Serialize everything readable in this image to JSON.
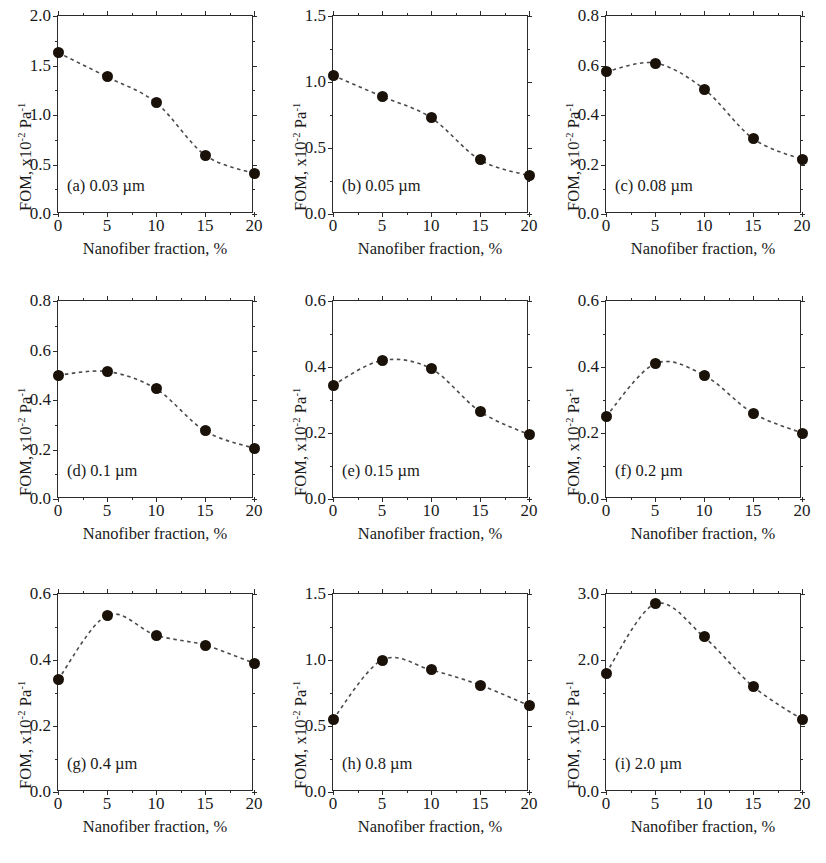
{
  "figure": {
    "panel_count": 9,
    "axis_x_title": "Nanofiber fraction, %",
    "axis_y_title_main": "FOM, x10",
    "axis_y_sup1": "-2",
    "axis_y_mid": " Pa",
    "axis_y_sup2": "-1",
    "marker_color": "#1a1209",
    "line_color": "#4a4a4a",
    "axis_color": "#2b2b2b"
  },
  "chart_data": [
    {
      "type": "scatter",
      "panel": "a",
      "title": "(a) 0.03 µm",
      "xlabel": "Nanofiber fraction, %",
      "ylabel": "FOM, x10-2 Pa-1",
      "x": [
        0,
        5,
        10,
        15,
        20
      ],
      "values": [
        1.63,
        1.385,
        1.125,
        0.595,
        0.41
      ],
      "xlim": [
        0,
        20
      ],
      "ylim": [
        0.0,
        2.0
      ],
      "xticks": [
        0,
        5,
        10,
        15,
        20
      ],
      "yticks": [
        0.0,
        0.5,
        1.0,
        1.5,
        2.0
      ],
      "ytick_labels": [
        "0.0",
        "0.5",
        "1.0",
        "1.5",
        "2.0"
      ],
      "grid": false,
      "legend": "none"
    },
    {
      "type": "scatter",
      "panel": "b",
      "title": "(b) 0.05 µm",
      "xlabel": "Nanofiber fraction, %",
      "ylabel": "FOM, x10-2 Pa-1",
      "x": [
        0,
        5,
        10,
        15,
        20
      ],
      "values": [
        1.05,
        0.89,
        0.73,
        0.41,
        0.29
      ],
      "xlim": [
        0,
        20
      ],
      "ylim": [
        0.0,
        1.5
      ],
      "xticks": [
        0,
        5,
        10,
        15,
        20
      ],
      "yticks": [
        0.0,
        0.5,
        1.0,
        1.5
      ],
      "ytick_labels": [
        "0.0",
        "0.5",
        "1.0",
        "1.5"
      ],
      "grid": false,
      "legend": "none"
    },
    {
      "type": "scatter",
      "panel": "c",
      "title": "(c) 0.08 µm",
      "xlabel": "Nanofiber fraction, %",
      "ylabel": "FOM, x10-2 Pa-1",
      "x": [
        0,
        5,
        10,
        15,
        20
      ],
      "values": [
        0.575,
        0.61,
        0.505,
        0.305,
        0.22
      ],
      "xlim": [
        0,
        20
      ],
      "ylim": [
        0.0,
        0.8
      ],
      "xticks": [
        0,
        5,
        10,
        15,
        20
      ],
      "yticks": [
        0.0,
        0.2,
        0.4,
        0.6,
        0.8
      ],
      "ytick_labels": [
        "0.0",
        "0.2",
        "0.4",
        "0.6",
        "0.8"
      ],
      "grid": false,
      "legend": "none"
    },
    {
      "type": "scatter",
      "panel": "d",
      "title": "(d) 0.1 µm",
      "xlabel": "Nanofiber fraction, %",
      "ylabel": "FOM, x10-2 Pa-1",
      "x": [
        0,
        5,
        10,
        15,
        20
      ],
      "values": [
        0.5,
        0.515,
        0.445,
        0.275,
        0.205
      ],
      "xlim": [
        0,
        20
      ],
      "ylim": [
        0.0,
        0.8
      ],
      "xticks": [
        0,
        5,
        10,
        15,
        20
      ],
      "yticks": [
        0.0,
        0.2,
        0.4,
        0.6,
        0.8
      ],
      "ytick_labels": [
        "0.0",
        "0.2",
        "0.4",
        "0.6",
        "0.8"
      ],
      "grid": false,
      "legend": "none"
    },
    {
      "type": "scatter",
      "panel": "e",
      "title": "(e) 0.15 µm",
      "xlabel": "Nanofiber fraction, %",
      "ylabel": "FOM, x10-2 Pa-1",
      "x": [
        0,
        5,
        10,
        15,
        20
      ],
      "values": [
        0.345,
        0.42,
        0.395,
        0.265,
        0.195
      ],
      "xlim": [
        0,
        20
      ],
      "ylim": [
        0.0,
        0.6
      ],
      "xticks": [
        0,
        5,
        10,
        15,
        20
      ],
      "yticks": [
        0.0,
        0.2,
        0.4,
        0.6
      ],
      "ytick_labels": [
        "0.0",
        "0.2",
        "0.4",
        "0.6"
      ],
      "grid": false,
      "legend": "none"
    },
    {
      "type": "scatter",
      "panel": "f",
      "title": "(f) 0.2 µm",
      "xlabel": "Nanofiber fraction, %",
      "ylabel": "FOM, x10-2 Pa-1",
      "x": [
        0,
        5,
        10,
        15,
        20
      ],
      "values": [
        0.25,
        0.41,
        0.375,
        0.26,
        0.2
      ],
      "xlim": [
        0,
        20
      ],
      "ylim": [
        0.0,
        0.6
      ],
      "xticks": [
        0,
        5,
        10,
        15,
        20
      ],
      "yticks": [
        0.0,
        0.2,
        0.4,
        0.6
      ],
      "ytick_labels": [
        "0.0",
        "0.2",
        "0.4",
        "0.6"
      ],
      "grid": false,
      "legend": "none"
    },
    {
      "type": "scatter",
      "panel": "g",
      "title": "(g) 0.4 µm",
      "xlabel": "Nanofiber fraction, %",
      "ylabel": "FOM, x10-2 Pa-1",
      "x": [
        0,
        5,
        10,
        15,
        20
      ],
      "values": [
        0.34,
        0.535,
        0.475,
        0.445,
        0.39
      ],
      "xlim": [
        0,
        20
      ],
      "ylim": [
        0.0,
        0.6
      ],
      "xticks": [
        0,
        5,
        10,
        15,
        20
      ],
      "yticks": [
        0.0,
        0.2,
        0.4,
        0.6
      ],
      "ytick_labels": [
        "0.0",
        "0.2",
        "0.4",
        "0.6"
      ],
      "grid": false,
      "legend": "none"
    },
    {
      "type": "scatter",
      "panel": "h",
      "title": "(h) 0.8 µm",
      "xlabel": "Nanofiber fraction, %",
      "ylabel": "FOM, x10-2 Pa-1",
      "x": [
        0,
        5,
        10,
        15,
        20
      ],
      "values": [
        0.55,
        1.0,
        0.925,
        0.81,
        0.655
      ],
      "xlim": [
        0,
        20
      ],
      "ylim": [
        0.0,
        1.5
      ],
      "xticks": [
        0,
        5,
        10,
        15,
        20
      ],
      "yticks": [
        0.0,
        0.5,
        1.0,
        1.5
      ],
      "ytick_labels": [
        "0.0",
        "0.5",
        "1.0",
        "1.5"
      ],
      "grid": false,
      "legend": "none"
    },
    {
      "type": "scatter",
      "panel": "i",
      "title": "(i) 2.0 µm",
      "xlabel": "Nanofiber fraction, %",
      "ylabel": "FOM, x10-2 Pa-1",
      "x": [
        0,
        5,
        10,
        15,
        20
      ],
      "values": [
        1.8,
        2.85,
        2.35,
        1.6,
        1.1
      ],
      "xlim": [
        0,
        20
      ],
      "ylim": [
        0.0,
        3.0
      ],
      "xticks": [
        0,
        5,
        10,
        15,
        20
      ],
      "yticks": [
        0.0,
        1.0,
        2.0,
        3.0
      ],
      "ytick_labels": [
        "0.0",
        "1.0",
        "2.0",
        "3.0"
      ],
      "grid": false,
      "legend": "none"
    }
  ]
}
